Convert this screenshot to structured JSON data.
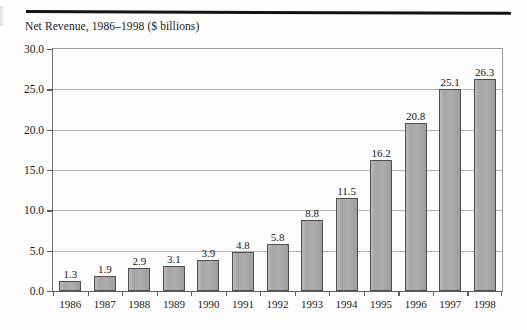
{
  "chart_data": {
    "type": "bar",
    "title": "Net Revenue, 1986–1998 ($ billions)",
    "xlabel": "",
    "ylabel": "",
    "categories": [
      "1986",
      "1987",
      "1988",
      "1989",
      "1990",
      "1991",
      "1992",
      "1993",
      "1994",
      "1995",
      "1996",
      "1997",
      "1998"
    ],
    "values": [
      1.3,
      1.9,
      2.9,
      3.1,
      3.9,
      4.8,
      5.8,
      8.8,
      11.5,
      16.2,
      20.8,
      25.1,
      26.3
    ],
    "value_labels": [
      "1.3",
      "1.9",
      "2.9",
      "3.1",
      "3.9",
      "4.8",
      "5.8",
      "8.8",
      "11.5",
      "16.2",
      "20.8",
      "25.1",
      "26.3"
    ],
    "ylim": [
      0,
      30
    ],
    "yticks": [
      0,
      5,
      10,
      15,
      20,
      25,
      30
    ],
    "ytick_labels": [
      "0.0",
      "5.0",
      "10.0",
      "15.0",
      "20.0",
      "25.0",
      "30.0"
    ],
    "grid": true,
    "legend": false,
    "legend_position": "none",
    "bar_color": "#a8a8a8",
    "bar_border_color": "#4f4f4f",
    "gridline_color": "#b4b4b4",
    "axis_color": "#5d5d5d",
    "text_color": "#1b1b1b",
    "background_color": "#fdfdfd"
  }
}
